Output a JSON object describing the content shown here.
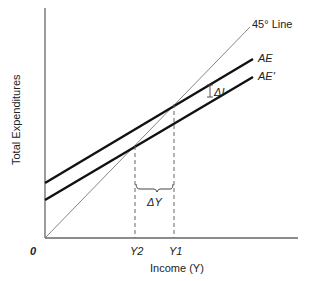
{
  "diagram": {
    "y_axis_label": "Total Expenditures",
    "x_axis_label": "Income (Y)",
    "origin_label": "0",
    "lines": {
      "forty_five": "45° Line",
      "ae": "AE",
      "ae_prime": "AE'"
    },
    "ticks": {
      "y2": "Y2",
      "y1": "Y1"
    },
    "annotations": {
      "delta_i": "ΔI",
      "delta_y": "ΔY"
    },
    "colors": {
      "axis": "#555555",
      "thick_line": "#111111",
      "thin_line": "#777777"
    }
  }
}
